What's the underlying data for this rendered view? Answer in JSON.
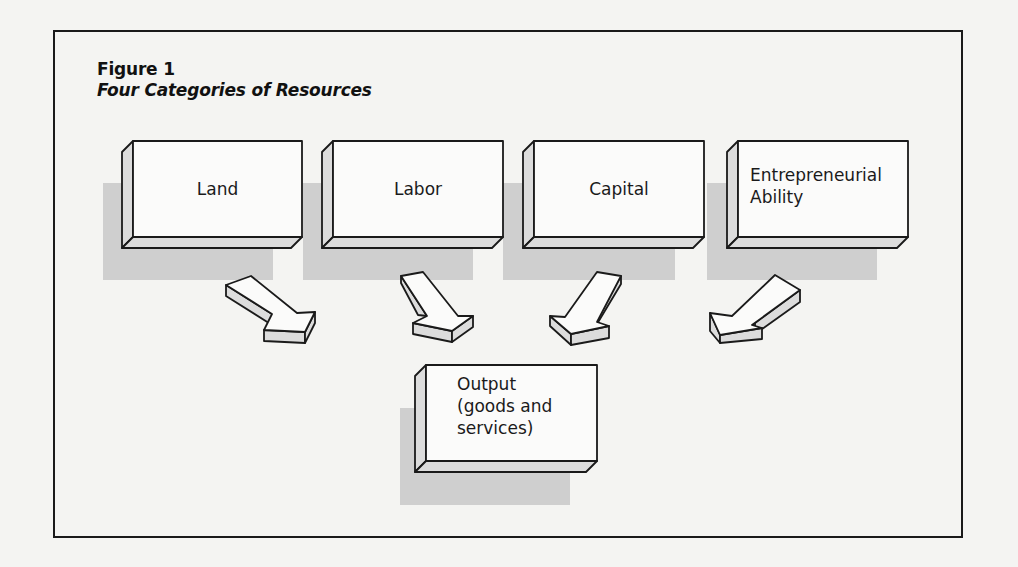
{
  "figure": {
    "label": "Figure 1",
    "title": "Four Categories of Resources"
  },
  "resources": [
    {
      "name": "Land"
    },
    {
      "name": "Labor"
    },
    {
      "name": "Capital"
    },
    {
      "name": "Entrepreneurial Ability",
      "line1": "Entrepreneurial",
      "line2": "Ability"
    }
  ],
  "output": {
    "line1": "Output",
    "line2": "(goods and",
    "line3": "services)"
  },
  "colors": {
    "shadow": "#cfcfcf",
    "box_face": "#fbfbfa",
    "box_side": "#dcdcdc",
    "stroke": "#1a1a1a"
  }
}
